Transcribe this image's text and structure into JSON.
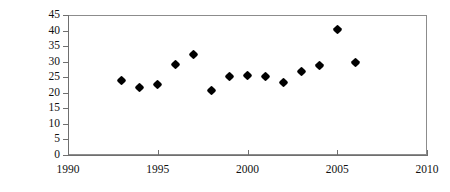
{
  "chart_data": {
    "type": "scatter",
    "title": "",
    "subtitle": "",
    "xlabel": "",
    "ylabel": "kg/capita",
    "xlim": [
      1990,
      2010
    ],
    "ylim": [
      0,
      45
    ],
    "xticks": [
      1990,
      1995,
      2000,
      2005,
      2010
    ],
    "yticks": [
      0,
      5,
      10,
      15,
      20,
      25,
      30,
      35,
      40,
      45
    ],
    "grid": false,
    "legend": null,
    "marker": "diamond",
    "marker_color": "#000000",
    "x": [
      1993,
      1994,
      1995,
      1996,
      1997,
      1998,
      1999,
      2000,
      2001,
      2002,
      2003,
      2004,
      2005,
      2006
    ],
    "values": [
      24.1,
      21.8,
      22.6,
      29.2,
      32.2,
      20.6,
      25.2,
      25.6,
      25.1,
      23.2,
      26.8,
      28.7,
      40.2,
      29.7
    ],
    "series": [
      {
        "name": "kg/capita",
        "points": [
          {
            "x": 1993,
            "y": 24.1
          },
          {
            "x": 1994,
            "y": 21.8
          },
          {
            "x": 1995,
            "y": 22.6
          },
          {
            "x": 1996,
            "y": 29.2
          },
          {
            "x": 1997,
            "y": 32.2
          },
          {
            "x": 1998,
            "y": 20.6
          },
          {
            "x": 1999,
            "y": 25.2
          },
          {
            "x": 2000,
            "y": 25.6
          },
          {
            "x": 2001,
            "y": 25.1
          },
          {
            "x": 2002,
            "y": 23.2
          },
          {
            "x": 2003,
            "y": 26.8
          },
          {
            "x": 2004,
            "y": 28.7
          },
          {
            "x": 2005,
            "y": 40.2
          },
          {
            "x": 2006,
            "y": 29.7
          }
        ]
      }
    ]
  },
  "axis": {
    "y_title": "kg/capita",
    "y_tick_labels": [
      "45",
      "40",
      "35",
      "30",
      "25",
      "20",
      "15",
      "10",
      "5",
      "0"
    ],
    "x_tick_labels": [
      "1990",
      "1995",
      "2000",
      "2005",
      "2010"
    ]
  },
  "colors": {
    "marker": "#000000",
    "axis": "#6f6f6f",
    "plot_border": "#8c8c8c",
    "background": "#ffffff",
    "text": "#111111"
  }
}
